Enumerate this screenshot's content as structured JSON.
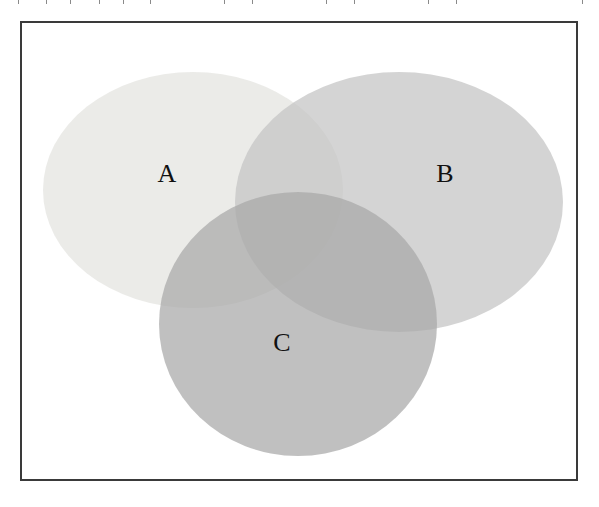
{
  "diagram": {
    "type": "venn",
    "sets": [
      {
        "id": "A",
        "label": "A",
        "fill": "#e6e6e2",
        "opacity": 0.75
      },
      {
        "id": "B",
        "label": "B",
        "fill": "#c4c4c4",
        "opacity": 0.75
      },
      {
        "id": "C",
        "label": "C",
        "fill": "#a8a8a8",
        "opacity": 0.75
      }
    ],
    "border_color": "#3a3a3a"
  }
}
